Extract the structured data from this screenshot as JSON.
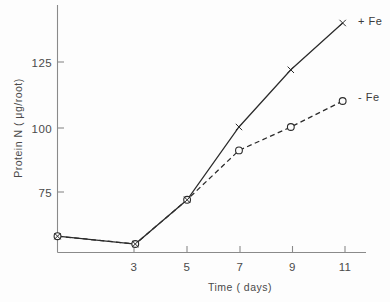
{
  "chart_data": {
    "type": "line",
    "title": "",
    "xlabel": "Time ( days)",
    "ylabel": "Protein N ( μg/root)",
    "x": [
      0,
      3,
      5,
      7,
      9,
      11
    ],
    "xticks": [
      3,
      5,
      7,
      9,
      11
    ],
    "xtick_labels": [
      "3",
      "5",
      "7",
      "9",
      "11"
    ],
    "yticks": [
      75,
      100,
      125
    ],
    "ytick_labels": [
      "75",
      "100",
      "125"
    ],
    "xlim": [
      0,
      11.9
    ],
    "ylim": [
      50,
      145
    ],
    "grid": false,
    "legend_position": "right-inline",
    "series": [
      {
        "name": "+ Fe",
        "marker": "x",
        "linestyle": "solid",
        "color": "#2b2b2b",
        "values": [
          58,
          55,
          72,
          100,
          122,
          140
        ]
      },
      {
        "name": "- Fe",
        "marker": "o",
        "linestyle": "dashed",
        "color": "#2b2b2b",
        "values": [
          58,
          55,
          72,
          91,
          100,
          110
        ]
      }
    ],
    "annotations": [
      {
        "text": "+ Fe",
        "series": "+ Fe"
      },
      {
        "text": "- Fe",
        "series": "- Fe"
      }
    ]
  }
}
